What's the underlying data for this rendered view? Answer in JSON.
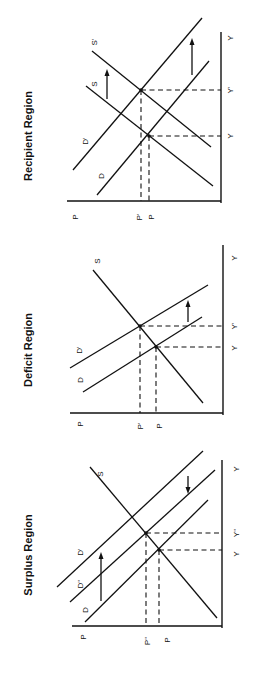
{
  "figure": {
    "orientation": "rotated 90 degrees counter-clockwise",
    "panels": [
      {
        "id": "recipient",
        "title": "Recipient Region",
        "axis_labels": {
          "price": "P",
          "quantity": "Y"
        },
        "price_ticks": [
          "P'",
          "P"
        ],
        "quantity_ticks": [
          "Y",
          "Y'"
        ],
        "curves": [
          "D",
          "D'",
          "S",
          "S'"
        ],
        "shifts": [
          "Demand shifts D → D'",
          "Supply shifts S → S'"
        ]
      },
      {
        "id": "deficit",
        "title": "Deficit Region",
        "axis_labels": {
          "price": "P",
          "quantity": "Y"
        },
        "price_ticks": [
          "P'",
          "P"
        ],
        "quantity_ticks": [
          "Y",
          "Y'"
        ],
        "curves": [
          "D",
          "D'",
          "S"
        ],
        "shifts": [
          "Demand shifts D → D'"
        ]
      },
      {
        "id": "surplus",
        "title": "Surplus Region",
        "axis_labels": {
          "price": "P",
          "quantity": "Y"
        },
        "price_ticks": [
          "P''",
          "P"
        ],
        "quantity_ticks": [
          "Y",
          "Y''"
        ],
        "curves": [
          "D",
          "D''",
          "D'",
          "S"
        ],
        "shifts": [
          "Demand shifts D → D'",
          "Demand shifts back D' → D''"
        ]
      }
    ]
  },
  "labels": {
    "recipient": {
      "title": "Recipient Region",
      "p_axis": "P",
      "p_prime": "P'",
      "p_base": "P",
      "y_axis": "Y",
      "y_prime": "Y'",
      "y_base": "Y",
      "s": "S",
      "s_prime": "S'",
      "d": "D",
      "d_prime": "D'"
    },
    "deficit": {
      "title": "Deficit Region",
      "p_axis": "P",
      "p_prime": "P'",
      "p_base": "P",
      "y_axis": "Y",
      "y_prime": "Y'",
      "y_base": "Y",
      "s": "S",
      "d": "D",
      "d_prime": "D'"
    },
    "surplus": {
      "title": "Surplus Region",
      "p_axis": "P",
      "p_dprime": "P''",
      "p_base": "P",
      "y_axis": "Y",
      "y_dprime": "Y''",
      "y_base": "Y",
      "s": "S",
      "d": "D",
      "d_prime": "D'",
      "d_dprime": "D''"
    }
  }
}
